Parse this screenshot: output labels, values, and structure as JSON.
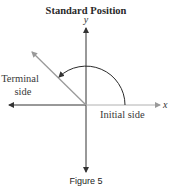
{
  "title": "Standard Position",
  "axes": {
    "x_label": "x",
    "y_label": "y"
  },
  "labels": {
    "terminal_line1": "Terminal",
    "terminal_line2": "side",
    "initial": "Initial side"
  },
  "angle_degrees": 135,
  "caption": "Figure 5",
  "colors": {
    "axis": "#3a3a3a",
    "terminal": "#9a9a9a",
    "initial": "#b0b0b0",
    "arc": "#2a2a2a"
  }
}
